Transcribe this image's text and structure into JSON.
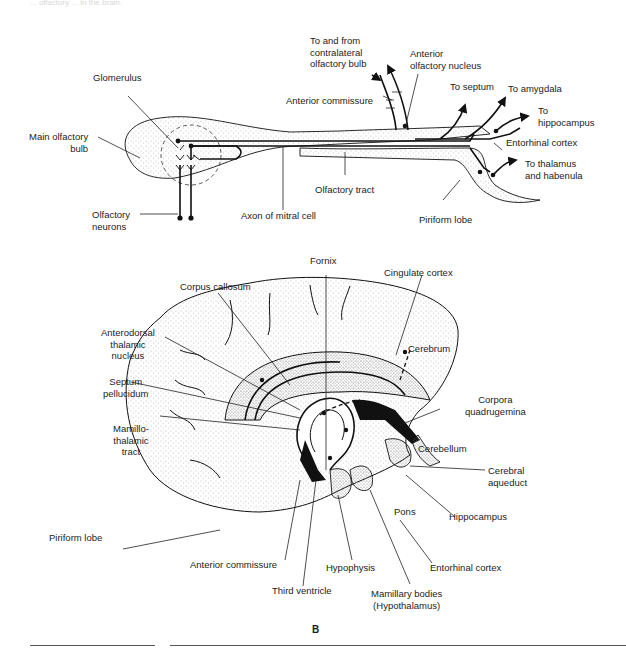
{
  "page": {
    "header_fragment": "... olfactory ... in the brain."
  },
  "figure_a": {
    "name": "olfactory-pathway-diagram",
    "labels": {
      "glomerulus": "Glomerulus",
      "main_olfactory_bulb": "Main olfactory\nbulb",
      "olfactory_neurons": "Olfactory\nneurons",
      "axon_of_mitral_cell": "Axon of mitral cell",
      "olfactory_tract": "Olfactory tract",
      "piriform_lobe": "Piriform lobe",
      "contralateral": "To and from\ncontralateral\nolfactory bulb",
      "anterior_olfactory_nucleus": "Anterior\nolfactory nucleus",
      "anterior_commissure": "Anterior commissure",
      "to_septum": "To septum",
      "to_amygdala": "To amygdala",
      "to_hippocampus": "To\nhippocampus",
      "entorhinal_cortex": "Entorhinal cortex",
      "to_thalamus": "To thalamus\nand habenula"
    }
  },
  "figure_b": {
    "name": "sagittal-brain-section-diagram",
    "letter": "B",
    "labels": {
      "fornix": "Fornix",
      "corpus_callosum": "Corpus callosum",
      "cingulate_cortex": "Cingulate cortex",
      "anterodorsal": "Anterodorsal\nthalamic\nnucleus",
      "cerebrum": "Cerebrum",
      "septum_pellucidum": "Septum\npellucidum",
      "corpora_quadrugemina": "Corpora\nquadrugemina",
      "mamillothalamic": "Mamillo-\nthalamic\ntract",
      "cerebellum": "Cerebellum",
      "cerebral_aqueduct": "Cerebral\naqueduct",
      "pons": "Pons",
      "hippocampus": "Hippocampus",
      "piriform_lobe": "Piriform lobe",
      "anterior_commissure": "Anterior commissure",
      "hypophysis": "Hypophysis",
      "entorhinal_cortex": "Entorhinal cortex",
      "third_ventricle": "Third ventricle",
      "mamillary_bodies": "Mamillary bodies\n(Hypothalamus)"
    }
  },
  "colors": {
    "ink": "#111111",
    "stipple": "#9a9a9a",
    "paper": "#ffffff"
  }
}
